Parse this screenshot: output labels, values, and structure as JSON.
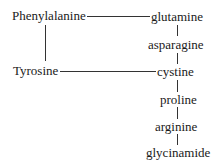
{
  "diagram": {
    "nodes": {
      "phenylalanine": "Phenylalanine",
      "tyrosine": "Tyrosine",
      "glutamine": "glutamine",
      "asparagine": "asparagine",
      "cystine": "cystine",
      "proline": "proline",
      "arginine": "arginine",
      "glycinamide": "glycinamide"
    },
    "edges": [
      [
        "Phenylalanine",
        "glutamine"
      ],
      [
        "Phenylalanine",
        "Tyrosine"
      ],
      [
        "Tyrosine",
        "cystine"
      ],
      [
        "glutamine",
        "asparagine"
      ],
      [
        "asparagine",
        "cystine"
      ],
      [
        "cystine",
        "proline"
      ],
      [
        "proline",
        "arginine"
      ],
      [
        "arginine",
        "glycinamide"
      ]
    ],
    "line_color": "#333333",
    "text_color": "#1a1a1a"
  }
}
